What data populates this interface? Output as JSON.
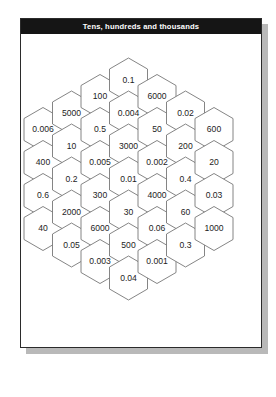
{
  "card": {
    "title": "Tens, hundreds and thousands"
  },
  "colors": {
    "title_bar_background": "#151515",
    "title_text": "#ffffff",
    "card_background": "#ffffff",
    "card_border": "#2b2b2b",
    "card_shadow": "#b9b9b9",
    "hex_stroke": "#777777",
    "hex_fill": "#ffffff",
    "hex_label": "#1d1d1d"
  },
  "hex_grid": {
    "type": "honeycomb",
    "layout": "pointy-top-rows-columns",
    "columns": 7,
    "total_cells": 37,
    "cells": [
      {
        "col": 1,
        "row": 1,
        "value": "0.006"
      },
      {
        "col": 1,
        "row": 2,
        "value": "400"
      },
      {
        "col": 1,
        "row": 3,
        "value": "0.6"
      },
      {
        "col": 1,
        "row": 4,
        "value": "40"
      },
      {
        "col": 2,
        "row": 1,
        "value": "5000"
      },
      {
        "col": 2,
        "row": 2,
        "value": "10"
      },
      {
        "col": 2,
        "row": 3,
        "value": "0.2"
      },
      {
        "col": 2,
        "row": 4,
        "value": "2000"
      },
      {
        "col": 2,
        "row": 5,
        "value": "0.05"
      },
      {
        "col": 3,
        "row": 1,
        "value": "100"
      },
      {
        "col": 3,
        "row": 2,
        "value": "0.5"
      },
      {
        "col": 3,
        "row": 3,
        "value": "0.005"
      },
      {
        "col": 3,
        "row": 4,
        "value": "300"
      },
      {
        "col": 3,
        "row": 5,
        "value": "6000"
      },
      {
        "col": 3,
        "row": 6,
        "value": "0.003"
      },
      {
        "col": 4,
        "row": 1,
        "value": "0.1"
      },
      {
        "col": 4,
        "row": 2,
        "value": "0.004"
      },
      {
        "col": 4,
        "row": 3,
        "value": "3000"
      },
      {
        "col": 4,
        "row": 4,
        "value": "0.01"
      },
      {
        "col": 4,
        "row": 5,
        "value": "30"
      },
      {
        "col": 4,
        "row": 6,
        "value": "500"
      },
      {
        "col": 4,
        "row": 7,
        "value": "0.04"
      },
      {
        "col": 5,
        "row": 1,
        "value": "6000"
      },
      {
        "col": 5,
        "row": 2,
        "value": "50"
      },
      {
        "col": 5,
        "row": 3,
        "value": "0.002"
      },
      {
        "col": 5,
        "row": 4,
        "value": "4000"
      },
      {
        "col": 5,
        "row": 5,
        "value": "0.06"
      },
      {
        "col": 5,
        "row": 6,
        "value": "0.001"
      },
      {
        "col": 6,
        "row": 1,
        "value": "0.02"
      },
      {
        "col": 6,
        "row": 2,
        "value": "200"
      },
      {
        "col": 6,
        "row": 3,
        "value": "0.4"
      },
      {
        "col": 6,
        "row": 4,
        "value": "60"
      },
      {
        "col": 6,
        "row": 5,
        "value": "0.3"
      },
      {
        "col": 7,
        "row": 1,
        "value": "600"
      },
      {
        "col": 7,
        "row": 2,
        "value": "20"
      },
      {
        "col": 7,
        "row": 3,
        "value": "0.03"
      },
      {
        "col": 7,
        "row": 4,
        "value": "1000"
      }
    ]
  }
}
